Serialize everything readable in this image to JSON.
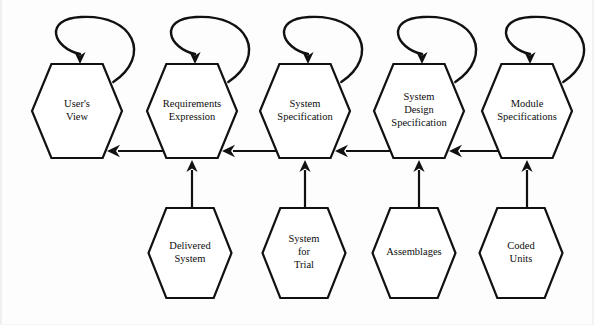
{
  "diagram": {
    "background_color": "#fdfdfd",
    "line_color": "#111111",
    "shape_fill": "#ffffff",
    "top_row": [
      {
        "id": "users-view",
        "label_lines": [
          "User's",
          "View"
        ],
        "cx": 77,
        "cy": 111,
        "self_loop": true
      },
      {
        "id": "requirements-expression",
        "label_lines": [
          "Requirements",
          "Expression"
        ],
        "cx": 192,
        "cy": 111,
        "self_loop": true
      },
      {
        "id": "system-specification",
        "label_lines": [
          "System",
          "Specification"
        ],
        "cx": 305,
        "cy": 111,
        "self_loop": true
      },
      {
        "id": "system-design-specification",
        "label_lines": [
          "System",
          "Design",
          "Specification"
        ],
        "cx": 419,
        "cy": 111,
        "self_loop": true
      },
      {
        "id": "module-specifications",
        "label_lines": [
          "Module",
          "Specifications"
        ],
        "cx": 527,
        "cy": 111,
        "self_loop": true
      }
    ],
    "bottom_row": [
      {
        "id": "delivered-system",
        "label_lines": [
          "Delivered",
          "System"
        ],
        "cx": 190,
        "cy": 253
      },
      {
        "id": "system-for-trial",
        "label_lines": [
          "System",
          "for",
          "Trial"
        ],
        "cx": 304,
        "cy": 253
      },
      {
        "id": "assemblages",
        "label_lines": [
          "Assemblages"
        ],
        "cx": 414,
        "cy": 253
      },
      {
        "id": "coded-units",
        "label_lines": [
          "Coded",
          "Units"
        ],
        "cx": 521,
        "cy": 253
      }
    ],
    "horizontal_arrows": [
      {
        "id": "arrow-req-to-user",
        "from": "requirements-expression",
        "to": "users-view",
        "direction": "left",
        "y": 151,
        "x_start": 163,
        "x_end": 107
      },
      {
        "id": "arrow-sysspec-to-req",
        "from": "system-specification",
        "to": "requirements-expression",
        "direction": "left",
        "y": 151,
        "x_start": 276,
        "x_end": 222
      },
      {
        "id": "arrow-design-to-sysspec",
        "from": "system-design-specification",
        "to": "system-specification",
        "direction": "left",
        "y": 151,
        "x_start": 390,
        "x_end": 335
      },
      {
        "id": "arrow-module-to-design",
        "from": "module-specifications",
        "to": "system-design-specification",
        "direction": "left",
        "y": 151,
        "x_start": 498,
        "x_end": 449
      }
    ],
    "vertical_arrows": [
      {
        "id": "arrow-delivered-to-req",
        "from": "delivered-system",
        "to": "requirements-expression",
        "direction": "up",
        "x": 192,
        "y_start": 208,
        "y_end": 160
      },
      {
        "id": "arrow-trial-to-sysspec",
        "from": "system-for-trial",
        "to": "system-specification",
        "direction": "up",
        "x": 305,
        "y_start": 208,
        "y_end": 160
      },
      {
        "id": "arrow-assemblages-to-design",
        "from": "assemblages",
        "to": "system-design-specification",
        "direction": "up",
        "x": 419,
        "y_start": 208,
        "y_end": 160
      },
      {
        "id": "arrow-coded-to-module",
        "from": "coded-units",
        "to": "module-specifications",
        "direction": "up",
        "x": 527,
        "y_start": 208,
        "y_end": 160
      }
    ]
  }
}
